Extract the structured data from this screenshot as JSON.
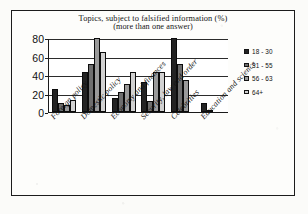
{
  "chart_data": {
    "type": "bar",
    "title": "Topics, subject to falsified information (%)",
    "subtitle": "(more than one answer)",
    "xlabel": "",
    "ylabel": "",
    "ylim": [
      0,
      80
    ],
    "yticks": [
      0,
      20,
      40,
      60,
      80
    ],
    "grid": true,
    "legend_position": "right",
    "categories": [
      "Foreign policy",
      "Domestic policy",
      "Economy and finances",
      "Security, law and order",
      "Celebrities",
      "Education and science"
    ],
    "series": [
      {
        "name": "18 - 30",
        "color": "#232323",
        "values": [
          25,
          43,
          15,
          32,
          80,
          10
        ]
      },
      {
        "name": "31 - 55",
        "color": "#6e6e6e",
        "values": [
          10,
          52,
          22,
          12,
          52,
          2
        ]
      },
      {
        "name": "56 - 63",
        "color": "#9a9a9a",
        "values": [
          8,
          80,
          30,
          43,
          35,
          0
        ]
      },
      {
        "name": "64+",
        "color": "#d2d2d2",
        "values": [
          13,
          65,
          43,
          43,
          0,
          0
        ]
      }
    ]
  },
  "legend": {
    "items": [
      {
        "label": "18 - 30"
      },
      {
        "label": "31 - 55"
      },
      {
        "label": "56 - 63"
      },
      {
        "label": "64+"
      }
    ]
  }
}
